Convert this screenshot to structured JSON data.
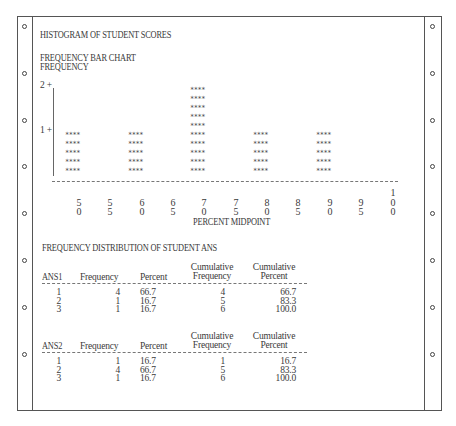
{
  "page": {
    "title": "HISTOGRAM OF STUDENT SCORES",
    "chart_heading": "FREQUENCY BAR CHART",
    "y_label": "FREQUENCY",
    "x_label": "PERCENT MIDPOINT"
  },
  "chart_data": {
    "type": "bar",
    "xlabel": "PERCENT MIDPOINT",
    "ylabel": "FREQUENCY",
    "categories": [
      "50",
      "55",
      "60",
      "65",
      "70",
      "75",
      "80",
      "85",
      "90",
      "95",
      "100"
    ],
    "values": [
      1,
      0,
      1,
      0,
      2,
      0,
      1,
      0,
      1,
      0,
      0
    ],
    "y_ticks": [
      "1",
      "2"
    ],
    "ylim": [
      0,
      2
    ],
    "bar_glyph": "****",
    "grid": false
  },
  "axis": {
    "y_ticks": [
      {
        "label": "2 +"
      },
      {
        "label": "1 +"
      }
    ],
    "x_ticks": [
      {
        "top": "",
        "mid": "5",
        "bot": "0"
      },
      {
        "top": "",
        "mid": "5",
        "bot": "5"
      },
      {
        "top": "",
        "mid": "6",
        "bot": "0"
      },
      {
        "top": "",
        "mid": "6",
        "bot": "5"
      },
      {
        "top": "",
        "mid": "7",
        "bot": "0"
      },
      {
        "top": "",
        "mid": "7",
        "bot": "5"
      },
      {
        "top": "",
        "mid": "8",
        "bot": "0"
      },
      {
        "top": "",
        "mid": "8",
        "bot": "5"
      },
      {
        "top": "",
        "mid": "9",
        "bot": "0"
      },
      {
        "top": "",
        "mid": "9",
        "bot": "5"
      },
      {
        "top": "1",
        "mid": "0",
        "bot": "0"
      }
    ]
  },
  "freq_table": {
    "title": "FREQUENCY DISTRIBUTION OF STUDENT ANS",
    "tables": [
      {
        "var": "ANS1",
        "headers": {
          "freq": "Frequency",
          "pct": "Percent",
          "cumfreq_1": "Cumulative",
          "cumfreq_2": "Frequency",
          "cumpct_1": "Cumulative",
          "cumpct_2": "Percent"
        },
        "rows": [
          {
            "val": "1",
            "freq": "4",
            "pct": "66.7",
            "cumfreq": "4",
            "cumpct": "66.7"
          },
          {
            "val": "2",
            "freq": "1",
            "pct": "16.7",
            "cumfreq": "5",
            "cumpct": "83.3"
          },
          {
            "val": "3",
            "freq": "1",
            "pct": "16.7",
            "cumfreq": "6",
            "cumpct": "100.0"
          }
        ]
      },
      {
        "var": "ANS2",
        "headers": {
          "freq": "Frequency",
          "pct": "Percent",
          "cumfreq_1": "Cumulative",
          "cumfreq_2": "Frequency",
          "cumpct_1": "Cumulative",
          "cumpct_2": "Percent"
        },
        "rows": [
          {
            "val": "1",
            "freq": "1",
            "pct": "16.7",
            "cumfreq": "1",
            "cumpct": "16.7"
          },
          {
            "val": "2",
            "freq": "4",
            "pct": "66.7",
            "cumfreq": "5",
            "cumpct": "83.3"
          },
          {
            "val": "3",
            "freq": "1",
            "pct": "16.7",
            "cumfreq": "6",
            "cumpct": "100.0"
          }
        ]
      }
    ]
  }
}
